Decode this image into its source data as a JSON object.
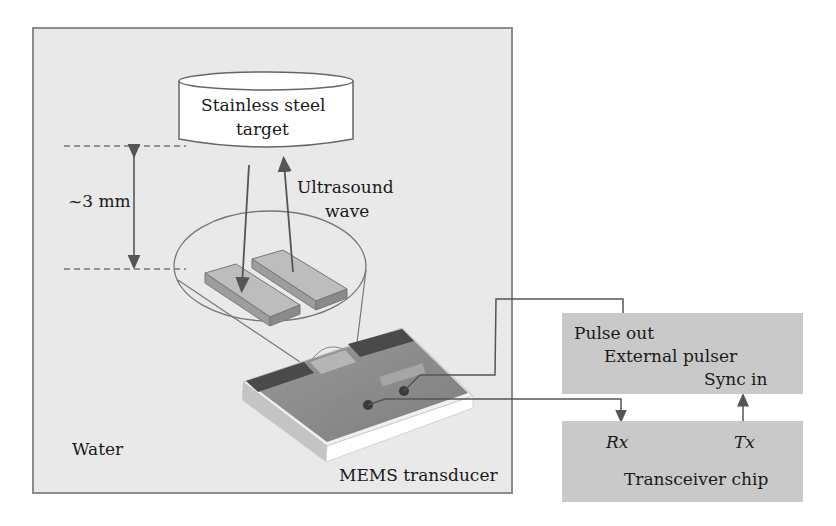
{
  "diagram": {
    "type": "schematic",
    "regions": {
      "water": {
        "label": "Water"
      }
    },
    "target": {
      "label_line1": "Stainless steel",
      "label_line2": "target"
    },
    "distance": {
      "label": "~3 mm"
    },
    "wave": {
      "label_line1": "Ultrasound",
      "label_line2": "wave"
    },
    "transducer": {
      "label": "MEMS transducer"
    },
    "external_pulser": {
      "title": "External pulser",
      "port_out": "Pulse out",
      "port_in": "Sync in"
    },
    "transceiver": {
      "title": "Transceiver chip",
      "port_rx": "Rx",
      "port_tx": "Tx"
    },
    "colors": {
      "water_bg": "#e9e9e9",
      "box_bg": "#c9c9c9",
      "line": "#555555",
      "chip_dark": "#4a4a4a",
      "chip_mid": "#8f8f8f"
    }
  }
}
